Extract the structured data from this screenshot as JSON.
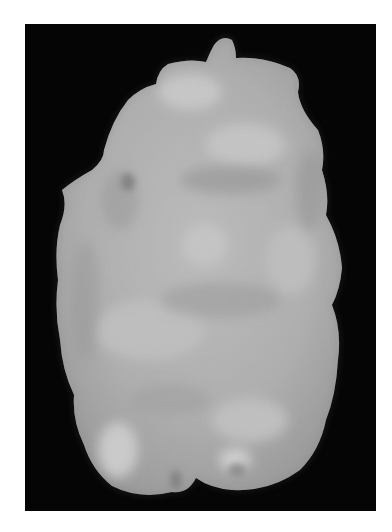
{
  "image": {
    "description": "Grayscale photograph of an irregular pale specimen on a black background",
    "background_color": "#050505",
    "border_color": "#ffffff",
    "specimen_color": "#b5b5b5"
  }
}
